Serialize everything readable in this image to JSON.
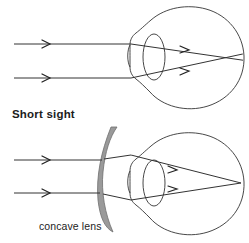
{
  "figure": {
    "width": 249,
    "height": 243,
    "background_color": "#ffffff",
    "stroke_color": "#333333",
    "lens_fill_color": "#9a9a9a",
    "lens_stroke_color": "#6e6e6e",
    "text_color": "#1c1c1c"
  },
  "labels": {
    "short_sight": "Short sight",
    "concave_lens": "concave lens"
  },
  "diagrams": [
    {
      "id": "uncorrected-eye",
      "caption": "Short sight",
      "description": "Parallel light rays entering a short-sighted eye focus in front of the retina, then cross and diverge before reaching the retina.",
      "has_corrective_lens": false,
      "ray_count": 2,
      "incoming_ray_y": [
        44,
        78
      ],
      "focus_relative_to_retina": "in front of retina",
      "eye": {
        "center_x": 196,
        "center_y": 57,
        "radius": 50,
        "cornea_front_x": 130,
        "lens_center_x": 154,
        "lens_rx": 11,
        "lens_ry": 23,
        "retina_x": 240
      },
      "focus_point": {
        "x": 213,
        "y": 57
      }
    },
    {
      "id": "corrected-eye",
      "caption": "concave lens",
      "description": "A concave (diverging) lens placed in front of the eye spreads the parallel rays so that they focus exactly on the retina.",
      "has_corrective_lens": true,
      "corrective_lens_type": "concave",
      "ray_count": 2,
      "incoming_ray_y": [
        160,
        193
      ],
      "focus_relative_to_retina": "on retina",
      "eye": {
        "center_x": 196,
        "center_y": 183,
        "radius": 50,
        "cornea_front_x": 130,
        "lens_center_x": 154,
        "lens_rx": 11,
        "lens_ry": 23,
        "retina_x": 240
      },
      "focus_point": {
        "x": 238,
        "y": 183
      },
      "concave_lens": {
        "top_y": 127,
        "bottom_y": 232,
        "front_x": 100,
        "apex_x": 118,
        "thickness": 10
      }
    }
  ],
  "annotations": {
    "arrow_style": "open chevron",
    "arrow_positions_top": [
      {
        "x": 48,
        "y": 44
      },
      {
        "x": 48,
        "y": 78
      },
      {
        "x": 188,
        "y": 50
      },
      {
        "x": 188,
        "y": 72
      }
    ],
    "arrow_positions_bottom": [
      {
        "x": 48,
        "y": 160
      },
      {
        "x": 48,
        "y": 193
      },
      {
        "x": 176,
        "y": 170
      },
      {
        "x": 176,
        "y": 193
      }
    ]
  }
}
